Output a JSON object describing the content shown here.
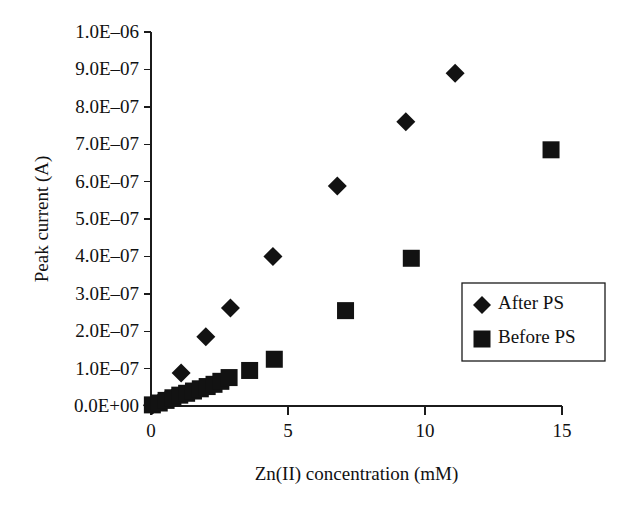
{
  "chart_data": {
    "type": "scatter",
    "title": "",
    "xlabel": "Zn(II) concentration (mM)",
    "ylabel": "Peak current (A)",
    "xlim": [
      0,
      15
    ],
    "ylim": [
      0,
      1e-06
    ],
    "xticks": [
      0,
      5,
      10,
      15
    ],
    "xtick_labels": [
      "0",
      "5",
      "10",
      "15"
    ],
    "yticks": [
      0,
      1e-07,
      2e-07,
      3e-07,
      4e-07,
      5e-07,
      6e-07,
      7e-07,
      8e-07,
      9e-07,
      1e-06
    ],
    "ytick_labels": [
      "0.0E+00",
      "1.0E–07",
      "2.0E–07",
      "3.0E–07",
      "4.0E–07",
      "5.0E–07",
      "6.0E–07",
      "7.0E–07",
      "8.0E–07",
      "9.0E–07",
      "1.0E–06"
    ],
    "grid": false,
    "legend_position": "right",
    "series": [
      {
        "name": "After PS",
        "marker": "diamond",
        "color": "#121212",
        "points": [
          [
            0.05,
            2e-09
          ],
          [
            0.25,
            7e-09
          ],
          [
            0.5,
            1.4e-08
          ],
          [
            0.75,
            2e-08
          ],
          [
            1.1,
            8.8e-08
          ],
          [
            2.0,
            1.85e-07
          ],
          [
            2.9,
            2.62e-07
          ],
          [
            4.45,
            4e-07
          ],
          [
            6.8,
            5.88e-07
          ],
          [
            9.3,
            7.6e-07
          ],
          [
            11.1,
            8.9e-07
          ]
        ]
      },
      {
        "name": "Before PS",
        "marker": "square",
        "color": "#121212",
        "points": [
          [
            0.05,
            3e-09
          ],
          [
            0.3,
            8e-09
          ],
          [
            0.55,
            1.5e-08
          ],
          [
            0.8,
            2.2e-08
          ],
          [
            1.05,
            2.9e-08
          ],
          [
            1.3,
            3.4e-08
          ],
          [
            1.55,
            4e-08
          ],
          [
            1.8,
            4.6e-08
          ],
          [
            2.05,
            5.2e-08
          ],
          [
            2.3,
            5.8e-08
          ],
          [
            2.55,
            6.6e-08
          ],
          [
            2.85,
            7.6e-08
          ],
          [
            3.6,
            9.5e-08
          ],
          [
            4.5,
            1.25e-07
          ],
          [
            7.1,
            2.55e-07
          ],
          [
            9.5,
            3.95e-07
          ],
          [
            14.6,
            6.85e-07
          ]
        ]
      }
    ]
  },
  "legend": {
    "entries": [
      {
        "label": "After PS",
        "marker": "diamond"
      },
      {
        "label": "Before PS",
        "marker": "square"
      }
    ]
  }
}
